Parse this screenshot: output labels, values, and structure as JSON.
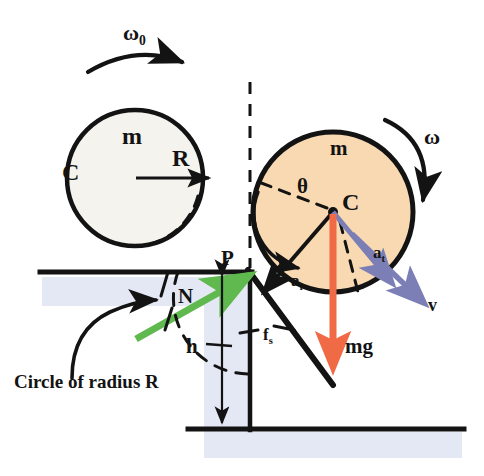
{
  "figure": {
    "caption": "Circle of radius R"
  },
  "colors": {
    "stroke": "#131313",
    "circle_left_fill": "#f4f3ee",
    "circle_right_fill": "#f8d9b2",
    "shade_blue": "#e4e8f4",
    "normal_force_green": "#5fb94f",
    "weight_orange": "#f06a45",
    "velocity_purple": "#7b7fb5",
    "page_background": "#ffffff"
  },
  "labels": {
    "omega_zero": {
      "text": "ω",
      "sub": "0",
      "x": 123,
      "y": 24
    },
    "omega": {
      "text": "ω",
      "sub": "",
      "x": 424,
      "y": 126
    },
    "mass_left": {
      "text": "m",
      "sub": "",
      "x": 122,
      "y": 128
    },
    "center_left": {
      "text": "C",
      "sub": "",
      "x": 62,
      "y": 160
    },
    "radius_left": {
      "text": "R",
      "sub": "",
      "x": 172,
      "y": 150
    },
    "mass_right": {
      "text": "m",
      "sub": "",
      "x": 330,
      "y": 142
    },
    "center_right": {
      "text": "C",
      "sub": "",
      "x": 340,
      "y": 196
    },
    "theta": {
      "text": "θ",
      "sub": "",
      "x": 297,
      "y": 181
    },
    "point_p": {
      "text": "P",
      "sub": "",
      "x": 222,
      "y": 250
    },
    "normal_force": {
      "text": "N",
      "sub": "",
      "x": 178,
      "y": 288
    },
    "height_h": {
      "text": "h",
      "sub": "",
      "x": 188,
      "y": 346
    },
    "friction": {
      "text": "f",
      "sub": "s",
      "x": 263,
      "y": 330
    },
    "weight": {
      "text": "mg",
      "sub": "",
      "x": 345,
      "y": 340
    },
    "accel_radial": {
      "text": "a",
      "sub": "r",
      "x": 291,
      "y": 277
    },
    "accel_tangential": {
      "text": "a",
      "sub": "t",
      "x": 373,
      "y": 248
    },
    "velocity": {
      "text": "v",
      "sub": "",
      "x": 428,
      "y": 300
    },
    "caption_circle": {
      "text": "Circle of radius R",
      "x": 14,
      "y": 374
    }
  },
  "geometry": {
    "circle_left": {
      "cx": 135,
      "cy": 178,
      "r": 68
    },
    "circle_right": {
      "cx": 333,
      "cy": 212,
      "r": 80
    },
    "dashed_circle_left": {
      "cx": 135,
      "cy": 178,
      "r": 68
    },
    "ground_upper_y": 272,
    "ground_lower_y": 428,
    "step_x": 250,
    "ground_upper_x_start": 40,
    "ground_lower_x_end": 464,
    "step_height_label": "h",
    "contact_point_P": {
      "x": 250,
      "y": 272
    }
  },
  "vectors": [
    {
      "name": "normal-force",
      "label": "N",
      "color": "#5fb94f",
      "from": [
        140,
        340
      ],
      "to": [
        250,
        274
      ]
    },
    {
      "name": "weight",
      "label": "mg",
      "color": "#f06a45",
      "from": [
        333,
        212
      ],
      "to": [
        333,
        372
      ]
    },
    {
      "name": "velocity",
      "label": "v",
      "color": "#7b7fb5",
      "from": [
        333,
        212
      ],
      "to": [
        420,
        300
      ]
    },
    {
      "name": "radial-acceleration",
      "label": "a_r",
      "color": "#131313",
      "from": [
        333,
        212
      ],
      "to": [
        262,
        292
      ]
    },
    {
      "name": "friction",
      "label": "f_s",
      "color": "#131313",
      "from": [
        250,
        272
      ],
      "to": [
        332,
        384
      ]
    },
    {
      "name": "radius",
      "label": "R",
      "color": "#131313",
      "from": [
        135,
        178
      ],
      "to": [
        212,
        178
      ]
    }
  ]
}
